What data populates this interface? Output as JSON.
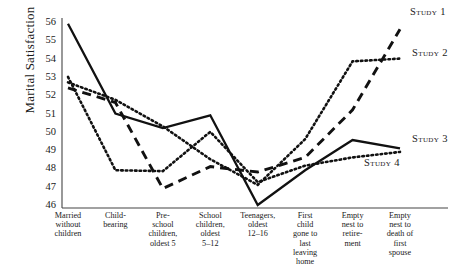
{
  "chart_data": {
    "type": "line",
    "title": "",
    "xlabel": "",
    "ylabel": "Marital Satisfaction",
    "ylim": [
      46,
      56
    ],
    "yticks": [
      46,
      47,
      48,
      49,
      50,
      51,
      52,
      53,
      54,
      55,
      56
    ],
    "grid": false,
    "legend_position": "right-inline",
    "categories": [
      "Married without children",
      "Child-bearing",
      "Pre-school children, oldest 5",
      "School children, oldest 5–12",
      "Teenagers, oldest 12–16",
      "First child gone to last leaving home",
      "Empty nest to retire-ment",
      "Empty nest to death of first spouse"
    ],
    "categories_display": [
      "Married\nwithout\nchildren",
      "Child-\nbearing",
      "Pre-\nschool\nchildren,\noldest 5",
      "School\nchildren,\noldest\n5–12",
      "Teenagers,\noldest\n12–16",
      "First\nchild\ngone to\nlast\nleaving\nhome",
      "Empty\nnest to\nretire-\nment",
      "Empty\nnest to\ndeath of\nfirst\nspouse"
    ],
    "series": [
      {
        "name": "Study 1",
        "style": "dashed",
        "color": "#111111",
        "values": [
          52.4,
          51.6,
          46.9,
          48.1,
          47.8,
          48.6,
          51.2,
          55.6
        ]
      },
      {
        "name": "Study 2",
        "style": "dotted",
        "color": "#111111",
        "values": [
          52.7,
          51.75,
          50.3,
          48.5,
          47.1,
          49.6,
          53.85,
          54.0
        ]
      },
      {
        "name": "Study 3",
        "style": "solid",
        "color": "#111111",
        "values": [
          55.9,
          51.0,
          50.2,
          50.9,
          46.0,
          47.9,
          49.55,
          49.1
        ]
      },
      {
        "name": "Study 4",
        "style": "dotted",
        "color": "#111111",
        "values": [
          53.0,
          47.9,
          47.85,
          50.0,
          47.25,
          48.15,
          48.6,
          48.9
        ]
      }
    ]
  },
  "legend": {
    "items": [
      {
        "label": "Study 1"
      },
      {
        "label": "Study 2"
      },
      {
        "label": "Study 3"
      },
      {
        "label": "Study 4"
      }
    ]
  },
  "axis": {
    "y_title": "Marital Satisfaction"
  }
}
